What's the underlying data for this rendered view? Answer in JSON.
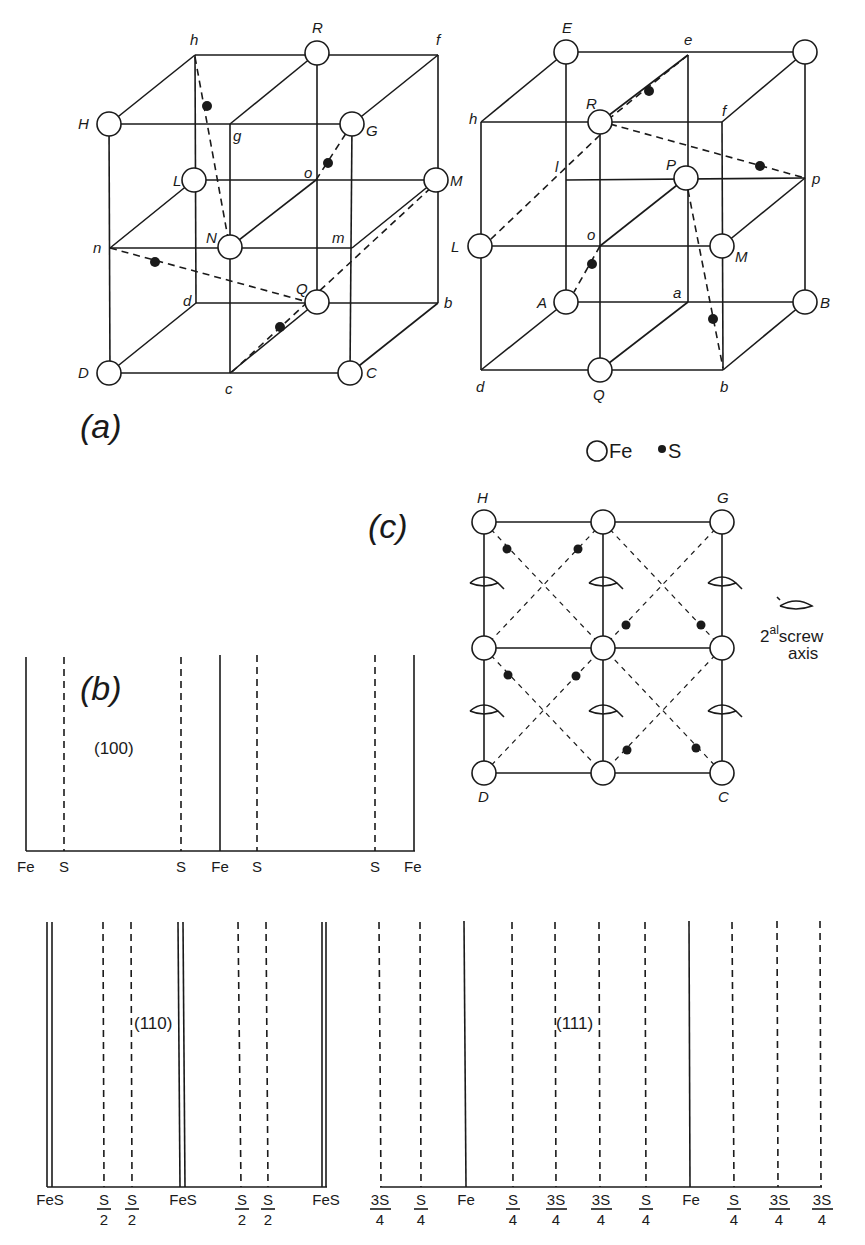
{
  "colors": {
    "ink": "#1a1a1a",
    "background": "#ffffff"
  },
  "legend": {
    "fe_label": "Fe",
    "s_label": "S"
  },
  "panel_a": {
    "label": "(a)",
    "left_cube": {
      "h": "h",
      "R": "R",
      "f": "f",
      "H": "H",
      "g": "g",
      "G": "G",
      "L": "L",
      "o": "o",
      "M": "M",
      "n": "n",
      "N": "N",
      "m": "m",
      "d": "d",
      "Q": "Q",
      "b": "b",
      "D": "D",
      "c": "c",
      "C": "C"
    },
    "right_cube": {
      "E": "E",
      "e": "e",
      "h": "h",
      "R": "R",
      "f": "f",
      "l": "l",
      "P": "P",
      "p": "p",
      "L": "L",
      "o": "o",
      "M": "M",
      "A": "A",
      "a": "a",
      "B": "B",
      "d": "d",
      "Q": "Q",
      "b": "b"
    }
  },
  "panel_b": {
    "label": "(b)",
    "plane_100": {
      "title": "(100)",
      "ticks": [
        "Fe",
        "S",
        "S",
        "Fe",
        "S",
        "S",
        "Fe"
      ]
    },
    "plane_110": {
      "title": "(110)",
      "ticks": [
        {
          "num": "FeS",
          "den": ""
        },
        {
          "num": "S",
          "den": "2"
        },
        {
          "num": "S",
          "den": "2"
        },
        {
          "num": "FeS",
          "den": ""
        },
        {
          "num": "S",
          "den": "2"
        },
        {
          "num": "S",
          "den": "2"
        },
        {
          "num": "FeS",
          "den": ""
        }
      ]
    },
    "plane_111": {
      "title": "(111)",
      "ticks": [
        {
          "num": "3S",
          "den": "4"
        },
        {
          "num": "S",
          "den": "4"
        },
        {
          "num": "Fe",
          "den": ""
        },
        {
          "num": "S",
          "den": "4"
        },
        {
          "num": "3S",
          "den": "4"
        },
        {
          "num": "3S",
          "den": "4"
        },
        {
          "num": "S",
          "den": "4"
        },
        {
          "num": "Fe",
          "den": ""
        },
        {
          "num": "S",
          "den": "4"
        },
        {
          "num": "3S",
          "den": "4"
        },
        {
          "num": "3S",
          "den": "4"
        }
      ]
    }
  },
  "panel_c": {
    "label": "(c)",
    "corners": {
      "top_left": "H",
      "top_right": "G",
      "bottom_left": "D",
      "bottom_right": "C"
    },
    "screw_legend": {
      "base": "2",
      "superscript": "al",
      "line1": "screw",
      "line2": "axis"
    }
  }
}
